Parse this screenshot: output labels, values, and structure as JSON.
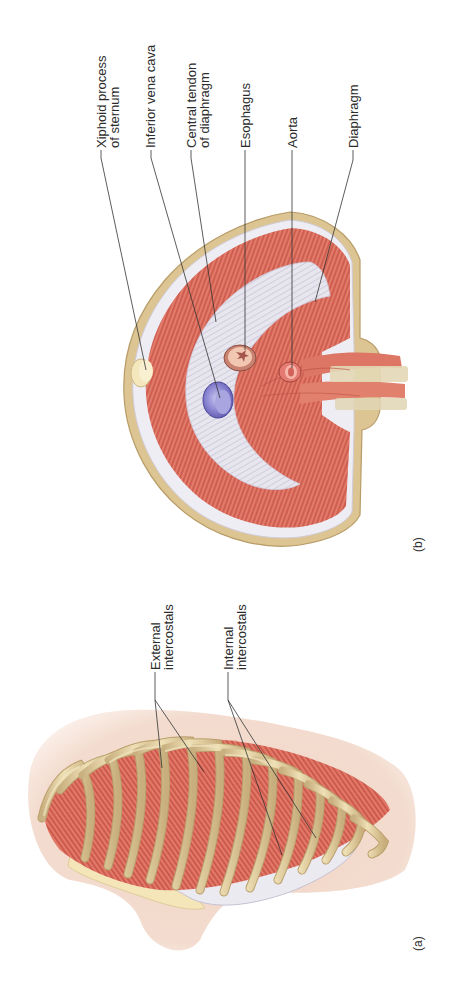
{
  "figure": {
    "orientation": "rotated-90-ccw",
    "panels": [
      {
        "id": "a",
        "label": "(a)",
        "subject": "rib cage with intercostal muscles",
        "callouts": [
          {
            "lines": [
              "External",
              "intercostals"
            ]
          },
          {
            "lines": [
              "Internal",
              "intercostals"
            ]
          }
        ]
      },
      {
        "id": "b",
        "label": "(b)",
        "subject": "diaphragm, inferior view",
        "callouts": [
          {
            "lines": [
              "Xiphoid process",
              "of sternum"
            ]
          },
          {
            "lines": [
              "Inferior vena cava"
            ]
          },
          {
            "lines": [
              "Central tendon",
              "of diaphragm"
            ]
          },
          {
            "lines": [
              "Esophagus"
            ]
          },
          {
            "lines": [
              "Aorta"
            ]
          },
          {
            "lines": [
              "Diaphragm"
            ]
          }
        ]
      }
    ]
  },
  "colors": {
    "muscle": "#d9675a",
    "muscle_light": "#ea8c79",
    "muscle_dark": "#b4463c",
    "bone": "#e6d3a3",
    "bone_dark": "#bfa673",
    "tendon": "#e4e2ec",
    "tendon_shadow": "#c9c6d6",
    "skin": "#f2d8ca",
    "ivc": "#7d78c8",
    "cartilage": "#f5e9bf",
    "leader_line": "#333333",
    "text": "#2b2b2b"
  }
}
